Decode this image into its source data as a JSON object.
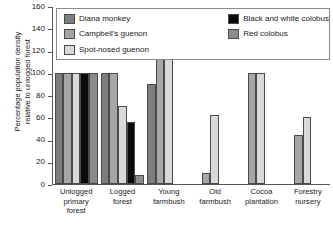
{
  "chart_data": {
    "type": "bar",
    "title": "",
    "xlabel": "",
    "ylabel": "Percentage population density\nrelative to unlogged forest",
    "ylim": [
      0,
      160
    ],
    "ytick_step": 20,
    "yticks": [
      0,
      20,
      40,
      60,
      80,
      100,
      120,
      140,
      160
    ],
    "grid": false,
    "legend_position": "top-inside",
    "categories": [
      "Unlogged\nprimary\nforest",
      "Logged\nforest",
      "Young\nfarmbush",
      "Old\nfarmbush",
      "Cocoa\nplantation",
      "Forestry\nnursery"
    ],
    "series": [
      {
        "name": "Diana monkey",
        "color": "#7d7d7d",
        "values": [
          100,
          100,
          90,
          null,
          null,
          null
        ]
      },
      {
        "name": "Campbell's guenon",
        "color": "#a6a6a6",
        "values": [
          100,
          100,
          116,
          10,
          100,
          44
        ]
      },
      {
        "name": "Spot-nosed guenon",
        "color": "#d9d9d9",
        "values": [
          100,
          70,
          142,
          62,
          100,
          60
        ]
      },
      {
        "name": "Black and white colobus",
        "color": "#0a0a0a",
        "values": [
          100,
          56,
          null,
          null,
          null,
          null
        ]
      },
      {
        "name": "Red colobus",
        "color": "#8c8c8c",
        "values": [
          100,
          8,
          null,
          null,
          null,
          null
        ]
      }
    ]
  },
  "axis": {
    "tick_labels": [
      "160",
      "140",
      "120",
      "100",
      "80",
      "60",
      "40",
      "20",
      "0"
    ]
  },
  "legend": {
    "left_items": [
      {
        "label": "Diana monkey",
        "color": "#7d7d7d"
      },
      {
        "label": "Campbell's guenon",
        "color": "#a6a6a6"
      },
      {
        "label": "Spot-nosed guenon",
        "color": "#d9d9d9"
      }
    ],
    "right_items": [
      {
        "label": "Black and white colobus",
        "color": "#0a0a0a"
      },
      {
        "label": "Red colobus",
        "color": "#8c8c8c"
      }
    ]
  }
}
